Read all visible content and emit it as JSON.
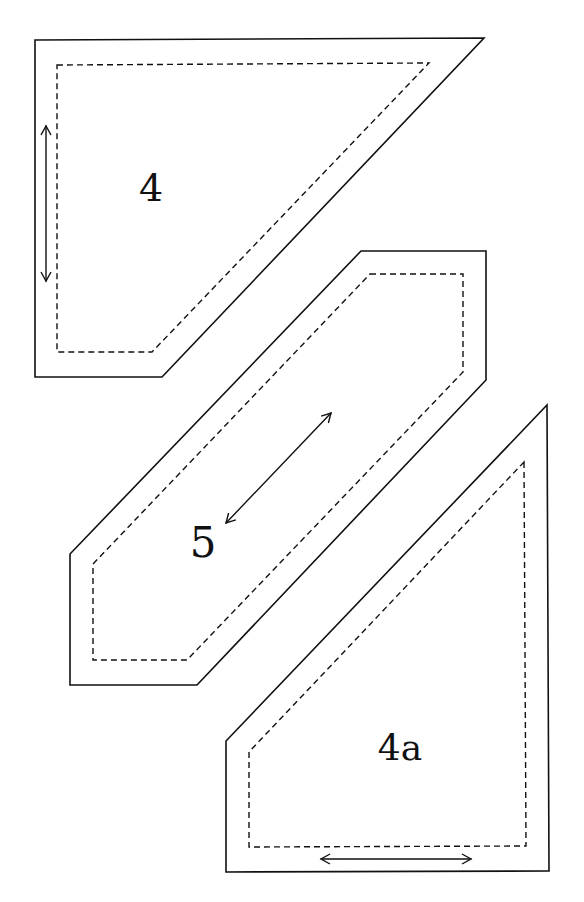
{
  "diagram": {
    "type": "quilt-pattern-templates",
    "stroke_color": "#111111",
    "background_color": "#ffffff",
    "legend_semantics": {
      "solid_line": "cutting line",
      "dashed_line": "sewing line",
      "double_arrow": "grain line"
    },
    "pieces": [
      {
        "id": "4",
        "label": "4",
        "label_pos": [
          151,
          201
        ],
        "label_size": 38,
        "cut_outline": [
          [
            35,
            40
          ],
          [
            484,
            38
          ],
          [
            162,
            377
          ],
          [
            35,
            377
          ]
        ],
        "sew_outline": [
          [
            57,
            65
          ],
          [
            429,
            63
          ],
          [
            152,
            352
          ],
          [
            57,
            352
          ]
        ],
        "grain_arrow": {
          "from": [
            46,
            126
          ],
          "to": [
            46,
            281
          ],
          "orientation": "vertical"
        }
      },
      {
        "id": "5",
        "label": "5",
        "label_pos": [
          203,
          557
        ],
        "label_size": 42,
        "cut_outline": [
          [
            361,
            251
          ],
          [
            486,
            251
          ],
          [
            486,
            380
          ],
          [
            197,
            685
          ],
          [
            70,
            685
          ],
          [
            70,
            554
          ]
        ],
        "sew_outline": [
          [
            370,
            274
          ],
          [
            463,
            274
          ],
          [
            463,
            372
          ],
          [
            187,
            660
          ],
          [
            93,
            660
          ],
          [
            93,
            564
          ]
        ],
        "grain_arrow": {
          "from": [
            226,
            523
          ],
          "to": [
            331,
            413
          ],
          "orientation": "diagonal"
        }
      },
      {
        "id": "4a",
        "label": "4a",
        "label_pos": [
          400,
          760
        ],
        "label_size": 36,
        "cut_outline": [
          [
            547,
            405
          ],
          [
            549,
            871
          ],
          [
            226,
            872
          ],
          [
            226,
            741
          ]
        ],
        "sew_outline": [
          [
            524,
            462
          ],
          [
            526,
            846
          ],
          [
            249,
            847
          ],
          [
            249,
            752
          ]
        ],
        "grain_arrow": {
          "from": [
            321,
            859
          ],
          "to": [
            471,
            859
          ],
          "orientation": "horizontal"
        }
      }
    ]
  }
}
